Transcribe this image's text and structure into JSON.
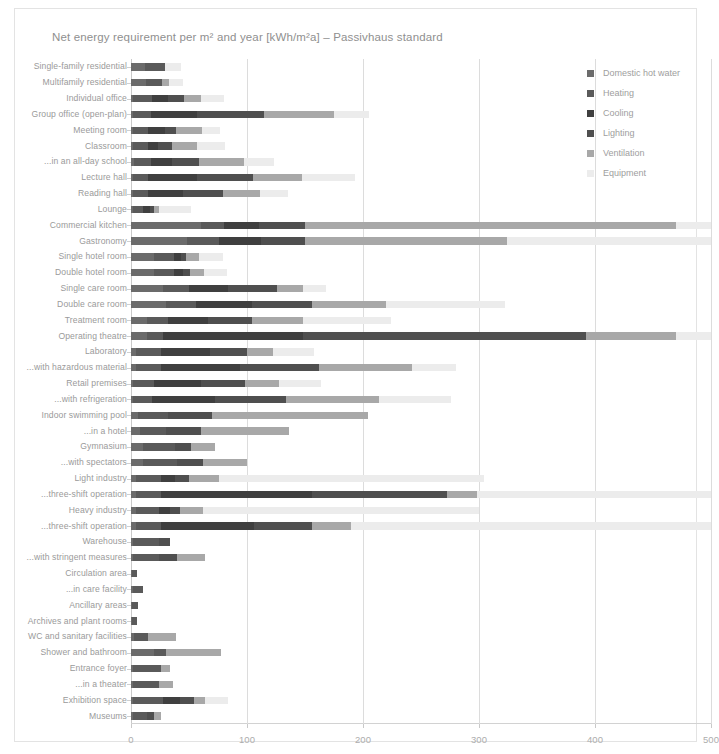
{
  "chart_data": {
    "type": "bar",
    "orientation": "horizontal",
    "stacked": true,
    "title": "Net energy requirement per m² and year [kWh/m²a] – Passivhaus standard",
    "xlabel": "",
    "ylabel": "",
    "xlim": [
      0,
      500
    ],
    "xticks": [
      0,
      100,
      200,
      300,
      400,
      500
    ],
    "xticklabels": [
      "0",
      "100",
      "200",
      "300",
      "400",
      "500"
    ],
    "grid": "vertical",
    "legend_position": "right",
    "colors": {
      "domestic_hot_water": "#6b6b6b",
      "heating": "#5a5a5a",
      "cooling": "#3f3f3f",
      "lighting": "#4f4f4f",
      "ventilation": "#a8a8a8",
      "equipment": "#ececec"
    },
    "legend": [
      "Domestic hot water",
      "Heating",
      "Cooling",
      "Lighting",
      "Ventilation",
      "Equipment"
    ],
    "categories": [
      "Single-family residential",
      "Multifamily residential",
      "Individual office",
      "Group office (open-plan)",
      "Meeting room",
      "Classroom",
      "...in an all-day school",
      "Lecture hall",
      "Reading hall",
      "Lounge",
      "Commercial kitchen",
      "Gastronomy",
      "Single hotel room",
      "Double hotel room",
      "Single care room",
      "Double care room",
      "Treatment room",
      "Operating theatre",
      "Laboratory",
      "...with hazardous material",
      "Retail premises",
      "...with refrigeration",
      "Indoor swimming pool",
      "...in a hotel",
      "Gymnasium",
      "...with spectators",
      "Light industry",
      "...three-shift operation",
      "Heavy industry",
      "...three-shift operation",
      "Warehouse",
      "...with stringent measures",
      "Circulation area",
      "...in care facility",
      "Ancillary areas",
      "Archives and plant rooms",
      "WC and sanitary facilities",
      "Shower and bathroom",
      "Entrance foyer",
      "...in a theater",
      "Exhibition space",
      "Museums"
    ],
    "series": [
      {
        "name": "Domestic hot water",
        "values": [
          12,
          13,
          2,
          2,
          2,
          2,
          3,
          2,
          2,
          2,
          60,
          48,
          20,
          20,
          28,
          30,
          14,
          14,
          4,
          4,
          2,
          2,
          6,
          8,
          10,
          10,
          4,
          4,
          4,
          4,
          2,
          2,
          1,
          2,
          1,
          1,
          3,
          20,
          2,
          2,
          2,
          2
        ]
      },
      {
        "name": "Heating",
        "values": [
          17,
          14,
          16,
          15,
          13,
          13,
          14,
          13,
          13,
          8,
          20,
          28,
          17,
          17,
          22,
          26,
          18,
          14,
          22,
          22,
          18,
          16,
          26,
          22,
          28,
          30,
          22,
          22,
          20,
          22,
          22,
          22,
          4,
          8,
          5,
          4,
          12,
          10,
          24,
          22,
          26,
          12
        ]
      },
      {
        "name": "Cooling",
        "values": [
          0,
          0,
          14,
          40,
          14,
          8,
          18,
          42,
          30,
          6,
          30,
          36,
          6,
          8,
          34,
          48,
          34,
          120,
          42,
          68,
          40,
          54,
          0,
          0,
          0,
          0,
          12,
          130,
          10,
          80,
          0,
          0,
          0,
          0,
          0,
          0,
          0,
          0,
          0,
          0,
          14,
          0
        ]
      },
      {
        "name": "Lighting",
        "values": [
          0,
          0,
          14,
          58,
          10,
          12,
          24,
          48,
          34,
          4,
          40,
          38,
          4,
          6,
          42,
          52,
          38,
          244,
          32,
          68,
          38,
          62,
          38,
          30,
          14,
          22,
          12,
          116,
          8,
          50,
          10,
          16,
          0,
          0,
          0,
          0,
          0,
          0,
          0,
          0,
          12,
          6
        ]
      },
      {
        "name": "Ventilation",
        "values": [
          0,
          6,
          14,
          60,
          22,
          22,
          38,
          42,
          32,
          4,
          320,
          174,
          12,
          12,
          22,
          64,
          44,
          78,
          22,
          80,
          30,
          80,
          134,
          76,
          20,
          38,
          26,
          26,
          20,
          34,
          0,
          24,
          0,
          0,
          0,
          0,
          24,
          48,
          8,
          12,
          10,
          6
        ]
      },
      {
        "name": "Equipment",
        "values": [
          14,
          12,
          20,
          30,
          16,
          24,
          26,
          46,
          24,
          28,
          30,
          176,
          20,
          20,
          20,
          102,
          76,
          30,
          36,
          38,
          36,
          62,
          0,
          0,
          0,
          0,
          228,
          202,
          238,
          310,
          0,
          0,
          0,
          0,
          0,
          0,
          0,
          0,
          0,
          0,
          20,
          0
        ]
      }
    ]
  }
}
